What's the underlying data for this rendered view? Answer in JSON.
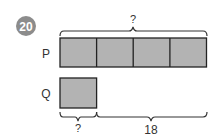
{
  "question": {
    "number": "20",
    "badge_color": "#8c8c8c"
  },
  "diagram": {
    "bar_fill": "#b3b3b3",
    "stroke_color": "#222222",
    "rows": [
      {
        "label": "P",
        "units": 4
      },
      {
        "label": "Q",
        "units": 1
      }
    ],
    "top_brace_label": "?",
    "bottom_left_brace_label": "?",
    "bottom_right_brace_label": "18"
  }
}
